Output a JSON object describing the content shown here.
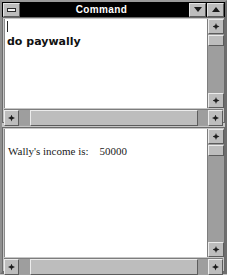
{
  "window": {
    "title": "Command",
    "system_menu_icon": "system-menu-box-icon",
    "minimize_icon": "triangle-down-icon",
    "maximize_icon": "triangle-up-icon"
  },
  "command_pane": {
    "name": "command-input-pane",
    "caret_visible": true,
    "text": "do paywally",
    "scrollbars": {
      "vertical": {
        "up_icon": "scroll-up-arrow-icon",
        "down_icon": "scroll-down-arrow-icon"
      },
      "horizontal": {
        "left_icon": "scroll-left-arrow-icon",
        "right_icon": "scroll-right-arrow-icon"
      }
    }
  },
  "output_pane": {
    "name": "command-output-pane",
    "text": "Wally's income is:    50000",
    "scrollbars": {
      "vertical": {
        "up_icon": "scroll-up-arrow-icon",
        "down_icon": "scroll-down-arrow-icon"
      },
      "horizontal": {
        "left_icon": "scroll-left-arrow-icon",
        "right_icon": "scroll-right-arrow-icon"
      }
    }
  },
  "colors": {
    "titlebar_bg": "#000000",
    "titlebar_fg": "#ffffff",
    "window_bg": "#c6c6c6",
    "text_bg": "#ffffff",
    "scrollbar_track": "#9e9e9e",
    "scrollbar_face": "#bdbdbd"
  }
}
